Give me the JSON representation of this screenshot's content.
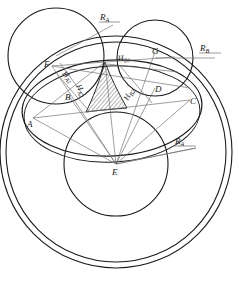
{
  "figure": {
    "background_color": "#ffffff",
    "stroke_color": "#1a1a1a",
    "thin_stroke_color": "#6b6b6b",
    "hatch_color": "#2b2b2b"
  },
  "points": [
    {
      "id": "A",
      "label": "A",
      "x": 33,
      "y": 118,
      "label_x": 27,
      "label_y": 127
    },
    {
      "id": "B",
      "label": "B",
      "x": 69,
      "y": 96,
      "label_x": 65,
      "label_y": 100
    },
    {
      "id": "C",
      "label": "C",
      "x": 190,
      "y": 100,
      "label_x": 190,
      "label_y": 102
    },
    {
      "id": "D",
      "label": "D",
      "x": 155,
      "y": 88,
      "label_x": 155,
      "label_y": 90
    },
    {
      "id": "E",
      "label": "E",
      "x": 116,
      "y": 164,
      "label_x": 113,
      "label_y": 173
    },
    {
      "id": "F",
      "label": "F",
      "x": 52,
      "y": 66,
      "label_x": 45,
      "label_y": 66
    },
    {
      "id": "G",
      "label": "G",
      "x": 155,
      "y": 52,
      "label_x": 152,
      "label_y": 53
    }
  ],
  "radius_labels": [
    {
      "id": "RA-top",
      "base": "R",
      "sub": "A",
      "x": 103,
      "y": 19
    },
    {
      "id": "RB-right",
      "base": "R",
      "sub": "B",
      "x": 203,
      "y": 50
    },
    {
      "id": "RA-bottom",
      "base": "R",
      "sub": "A",
      "x": 178,
      "y": 143
    }
  ],
  "distance_labels": [
    {
      "id": "HA1",
      "base": "H",
      "sub": "A1",
      "x": 70,
      "y": 73,
      "rotation": 48
    },
    {
      "id": "HA2",
      "base": "H",
      "sub": "A2",
      "x": 82,
      "y": 88,
      "rotation": 62
    },
    {
      "id": "HB1",
      "base": "H",
      "sub": "B1",
      "x": 131,
      "y": 60,
      "rotation": -4
    },
    {
      "id": "HB2",
      "base": "H",
      "sub": "B2",
      "x": 135,
      "y": 94,
      "rotation": -62
    }
  ],
  "circles": [
    {
      "id": "circle-A",
      "name": "left-circle",
      "cx": 56,
      "cy": 56,
      "r": 48,
      "width": 1.1
    },
    {
      "id": "circle-B",
      "name": "right-circle",
      "cx": 155,
      "cy": 58,
      "r": 38,
      "width": 1.1
    },
    {
      "id": "circle-E-in",
      "name": "inner-circle",
      "cx": 116,
      "cy": 164,
      "r": 52,
      "width": 1.1
    },
    {
      "id": "circle-E-mid",
      "name": "outer-circle-inner",
      "cx": 116,
      "cy": 152,
      "r": 110,
      "width": 1.1
    },
    {
      "id": "circle-E-out",
      "name": "outer-circle-outer",
      "cx": 116,
      "cy": 152,
      "r": 116,
      "width": 1.1
    }
  ],
  "ellipses": [
    {
      "id": "arc-1",
      "name": "upper-ellipse-outer",
      "cx": 112,
      "cy": 108,
      "rx": 90,
      "ry": 48,
      "rotation": -3,
      "width": 1.2
    },
    {
      "id": "arc-2",
      "name": "upper-ellipse-inner",
      "cx": 112,
      "cy": 114,
      "rx": 88,
      "ry": 48,
      "rotation": -3,
      "width": 1.0
    }
  ],
  "hatched_region": {
    "name": "curved-triangle",
    "apex_x": 105,
    "apex_y": 62,
    "left_x": 86,
    "left_y": 112,
    "right_x": 127,
    "right_y": 108,
    "hatch_spacing": 3
  },
  "notes": {
    "vertex_top": "Lines converge at the upper cusp of the hatched curved triangle",
    "hub": "All radial segments emanate from point E"
  }
}
